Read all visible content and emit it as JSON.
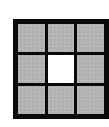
{
  "figure": {
    "type": "3x3-grid",
    "rows": 3,
    "cols": 3,
    "colors": {
      "border": "#0a0a0a",
      "filled": "#b4b4b4",
      "empty": "#ffffff"
    },
    "cells": [
      {
        "row": 0,
        "col": 0,
        "state": "filled"
      },
      {
        "row": 0,
        "col": 1,
        "state": "filled"
      },
      {
        "row": 0,
        "col": 2,
        "state": "filled"
      },
      {
        "row": 1,
        "col": 0,
        "state": "filled"
      },
      {
        "row": 1,
        "col": 1,
        "state": "empty"
      },
      {
        "row": 1,
        "col": 2,
        "state": "filled"
      },
      {
        "row": 2,
        "col": 0,
        "state": "filled"
      },
      {
        "row": 2,
        "col": 1,
        "state": "filled"
      },
      {
        "row": 2,
        "col": 2,
        "state": "filled"
      }
    ]
  }
}
